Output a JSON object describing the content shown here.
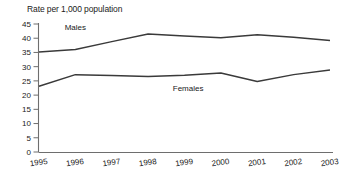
{
  "chart_data": {
    "type": "line",
    "title": "Rate per 1,000 population",
    "xlabel": "",
    "ylabel": "",
    "categories": [
      "1995",
      "1996",
      "1997",
      "1998",
      "1999",
      "2000",
      "2001",
      "2002",
      "2003"
    ],
    "x": [
      1995,
      1996,
      1997,
      1998,
      1999,
      2000,
      2001,
      2002,
      2003
    ],
    "series": [
      {
        "name": "Males",
        "values": [
          35.2,
          36.0,
          38.8,
          41.5,
          40.8,
          40.2,
          41.2,
          40.3,
          39.2
        ]
      },
      {
        "name": "Females",
        "values": [
          23.1,
          27.2,
          26.9,
          26.5,
          27.0,
          27.8,
          24.8,
          27.2,
          28.8
        ]
      }
    ],
    "ylim": [
      0,
      45
    ],
    "ytick_step": 5,
    "ytick_labels": [
      "45",
      "40",
      "35",
      "30",
      "25",
      "20",
      "15",
      "10",
      "5",
      "0"
    ],
    "ytick_values": [
      45,
      40,
      35,
      30,
      25,
      20,
      15,
      10,
      5,
      0
    ],
    "grid": false,
    "legend": "inline-annotations",
    "annotations": [
      {
        "text": "Males",
        "x": 1996.0,
        "y": 43.0
      },
      {
        "text": "Females",
        "x": 1999.1,
        "y": 21.5
      }
    ],
    "colors": {
      "line": "#3a3a3a",
      "axis": "#6e6e6e",
      "text": "#1a1a1a",
      "background": "#ffffff"
    }
  }
}
